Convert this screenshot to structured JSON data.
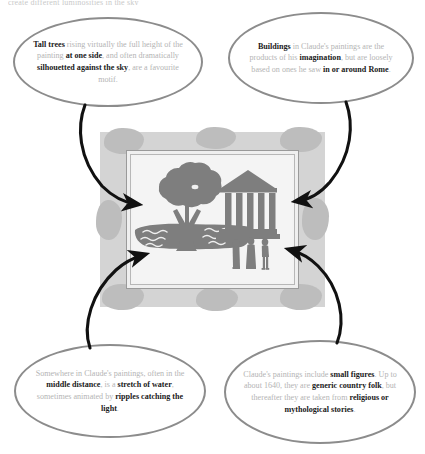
{
  "page": {
    "cut_off_header": "create different luminosities in the sky"
  },
  "bubbles": [
    {
      "id": "tall-trees",
      "name": "bubble-tall-trees",
      "position": "top-left",
      "segments": [
        {
          "text": "Tall trees",
          "bold": true
        },
        {
          "text": " rising virtually the full height of the painting ",
          "bold": false
        },
        {
          "text": "at one side",
          "bold": true
        },
        {
          "text": ", and often dramatically ",
          "bold": false
        },
        {
          "text": "silhouetted against the sky",
          "bold": true
        },
        {
          "text": ", are a favourite motif.",
          "bold": false
        }
      ],
      "plain": "Tall trees rising virtually the full height of the painting at one side, and often dramatically silhouetted against the sky, are a favourite motif."
    },
    {
      "id": "buildings",
      "name": "bubble-buildings",
      "position": "top-right",
      "segments": [
        {
          "text": "Buildings",
          "bold": true
        },
        {
          "text": " in Claude's paintings are the products of his ",
          "bold": false
        },
        {
          "text": "imagination",
          "bold": true
        },
        {
          "text": ", but are loosely based on ones he saw ",
          "bold": false
        },
        {
          "text": "in or around Rome",
          "bold": true
        },
        {
          "text": ".",
          "bold": false
        }
      ],
      "plain": "Buildings in Claude's paintings are the products of his imagination, but are loosely based on ones he saw in or around Rome."
    },
    {
      "id": "water",
      "name": "bubble-water",
      "position": "bottom-left",
      "segments": [
        {
          "text": "Somewhere in Claude's paintings, often in the ",
          "bold": false
        },
        {
          "text": "middle distance",
          "bold": true
        },
        {
          "text": ", is a ",
          "bold": false
        },
        {
          "text": "stretch of water",
          "bold": true
        },
        {
          "text": ", sometimes animated by ",
          "bold": false
        },
        {
          "text": "ripples catching the light",
          "bold": true
        },
        {
          "text": ".",
          "bold": false
        }
      ],
      "plain": "Somewhere in Claude's paintings, often in the middle distance, is a stretch of water, sometimes animated by ripples catching the light."
    },
    {
      "id": "figures",
      "name": "bubble-figures",
      "position": "bottom-right",
      "segments": [
        {
          "text": "Claude's paintings include ",
          "bold": false
        },
        {
          "text": "small figures",
          "bold": true
        },
        {
          "text": ". Up to about 1640, they are ",
          "bold": false
        },
        {
          "text": "generic country folk",
          "bold": true
        },
        {
          "text": ", but thereafter they are taken from ",
          "bold": false
        },
        {
          "text": "religious or mythological stories",
          "bold": true
        },
        {
          "text": ".",
          "bold": false
        }
      ],
      "plain": "Claude's paintings include small figures. Up to about 1640, they are generic country folk, but thereafter they are taken from religious or mythological stories."
    }
  ],
  "painting": {
    "name": "claude-landscape-diagram",
    "elements": [
      {
        "name": "tree-silhouette",
        "label": "Tall tree"
      },
      {
        "name": "classical-temple",
        "label": "Classical temple building",
        "columns": 5
      },
      {
        "name": "water-stretch",
        "label": "Stretch of water with ripples"
      },
      {
        "name": "small-figures",
        "label": "Small figures",
        "count": 3
      }
    ]
  },
  "colors": {
    "bubble_stroke": "#8c8c8c",
    "body_text": "#b4b4b4",
    "bold_text": "#1a1a1a",
    "frame": "#d4d4d4",
    "frame_ornament": "#bdbdbd",
    "canvas": "#f4f4f4",
    "silhouette": "#7e7e7e",
    "arrow": "#111111",
    "background": "#ffffff"
  },
  "arrows": [
    {
      "name": "arrow-tall-trees-to-tree",
      "from": "bubble-tall-trees",
      "to": "tree-silhouette"
    },
    {
      "name": "arrow-buildings-to-temple",
      "from": "bubble-buildings",
      "to": "classical-temple"
    },
    {
      "name": "arrow-water-to-water",
      "from": "bubble-water",
      "to": "water-stretch"
    },
    {
      "name": "arrow-figures-to-figures",
      "from": "bubble-figures",
      "to": "small-figures"
    }
  ]
}
